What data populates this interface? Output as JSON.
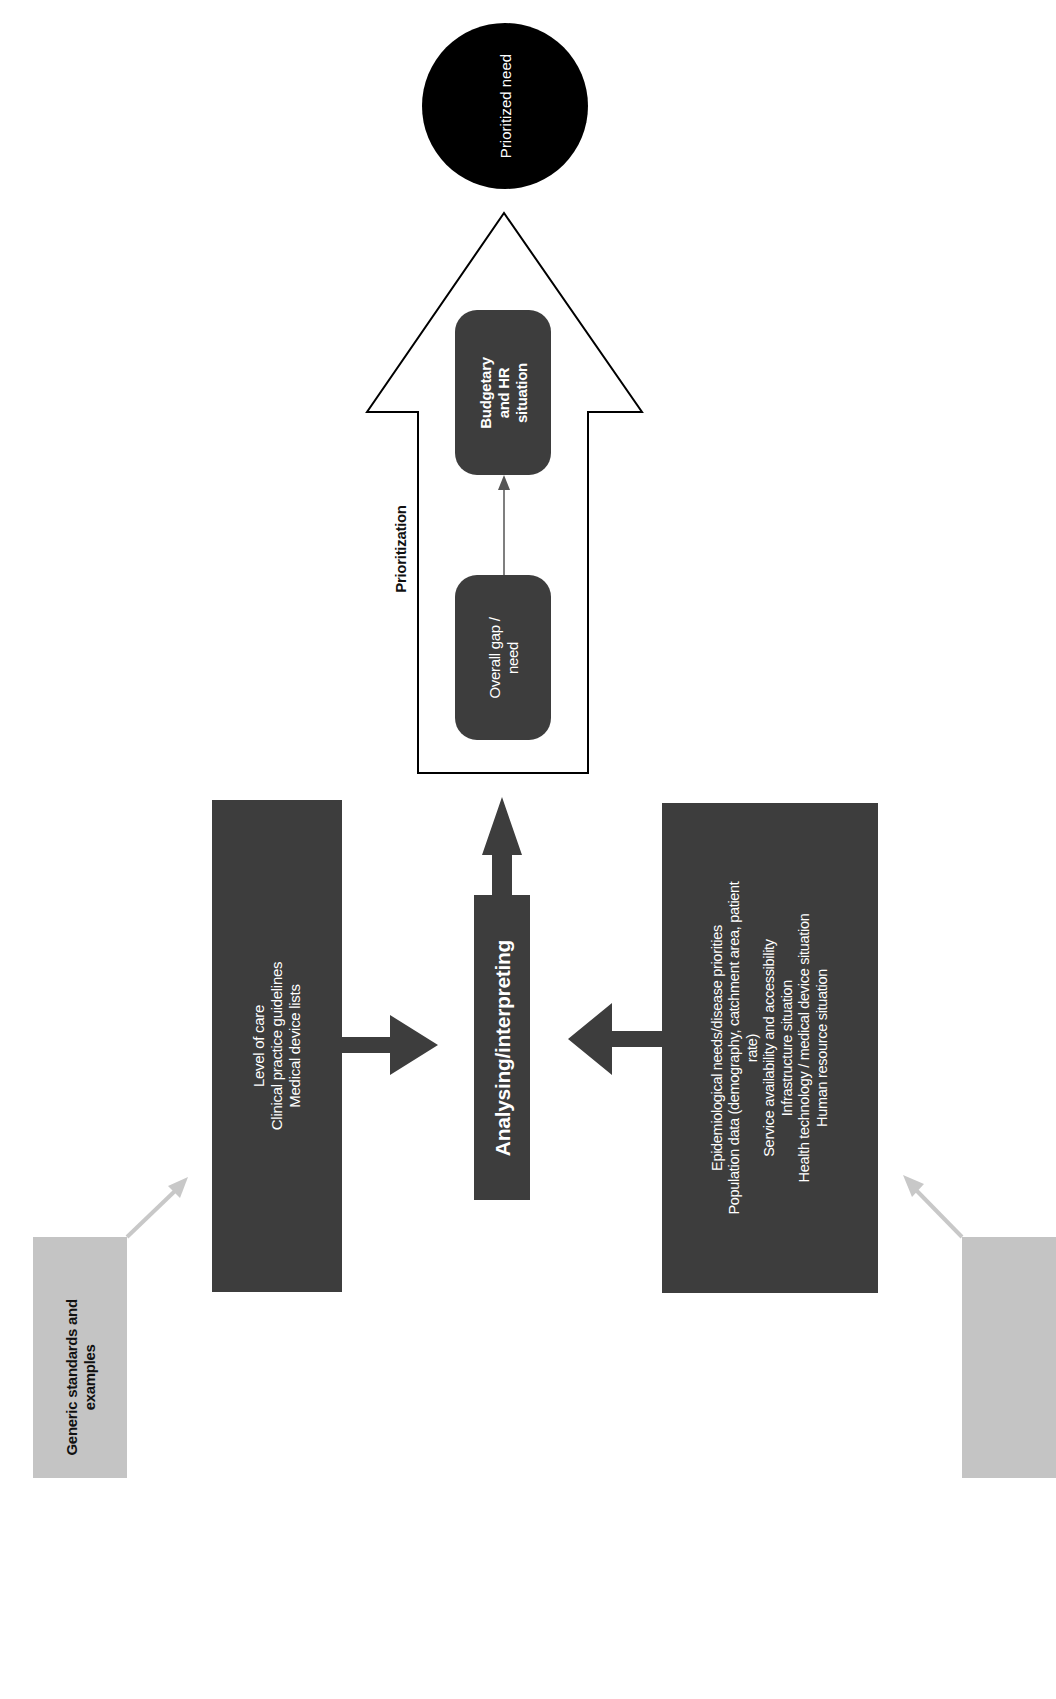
{
  "diagram": {
    "orientation": "rotated-90-ccw",
    "colors": {
      "dark_box": "#3d3d3d",
      "gray_box": "#c4c4c4",
      "gray_arrow": "#c8c8c8",
      "circle": "#000000",
      "outline": "#000000",
      "background": "#ffffff"
    },
    "generic_standards_label": "Generic standards and\nexamples",
    "standards_box": {
      "lines": "Level of care\nClinical practice guidelines\nMedical device lists"
    },
    "center_process": {
      "label": "Analysing/interpreting"
    },
    "situation_box": {
      "lines": "Epidemiological needs/disease priorities\nPopulation data (demography, catchment area, patient\nrate)\nService availability and accessibility\nInfrastructure situation\nHealth technology / medical device situation\nHuman resource situation"
    },
    "prioritization": {
      "label": "Prioritization",
      "steps": [
        {
          "label": "Overall gap /\nneed"
        },
        {
          "label": "Budgetary\nand HR\nsituation"
        }
      ]
    },
    "outcome": {
      "label": "Prioritized need"
    }
  }
}
